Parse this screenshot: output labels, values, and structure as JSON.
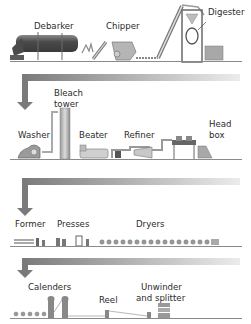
{
  "diagram": {
    "stages": [
      {
        "row": 1,
        "labels": [
          "Debarker",
          "Chipper",
          "Digester"
        ]
      },
      {
        "row": 2,
        "labels": [
          "Washer",
          "Bleach tower",
          "Beater",
          "Refiner",
          "Head box"
        ]
      },
      {
        "row": 3,
        "labels": [
          "Former",
          "Presses",
          "Dryers"
        ]
      },
      {
        "row": 4,
        "labels": [
          "Calenders",
          "Reel",
          "Unwinder and splitter"
        ]
      }
    ],
    "labels": {
      "debarker": "Debarker",
      "chipper": "Chipper",
      "digester": "Digester",
      "washer": "Washer",
      "bleach_1": "Bleach",
      "bleach_2": "tower",
      "beater": "Beater",
      "refiner": "Refiner",
      "headbox_1": "Head",
      "headbox_2": "box",
      "former": "Former",
      "presses": "Presses",
      "dryers": "Dryers",
      "calenders": "Calenders",
      "reel": "Reel",
      "unwinder_1": "Unwinder",
      "unwinder_2": "and splitter"
    },
    "colors": {
      "machine_dark": "#5a5a5a",
      "machine_mid": "#9a9a9a",
      "machine_light": "#c8c8c8",
      "arrow_dark": "#7a7a7a",
      "arrow_light": "#e6e6e6",
      "ground": "#8a8a8a"
    }
  }
}
